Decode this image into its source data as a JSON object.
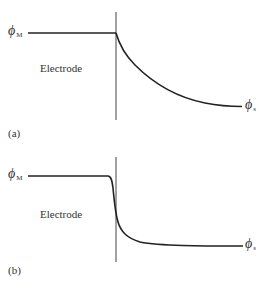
{
  "panels": [
    {
      "id": "a",
      "panel_label": "(a)",
      "region_label": "Electrode",
      "left_potential": {
        "symbol": "ϕ",
        "subscript": "M"
      },
      "right_potential": {
        "symbol": "ϕ",
        "subscript": "s"
      },
      "description": "Potential profile: constant ϕM inside electrode, gradual exponential decay into solution toward ϕs"
    },
    {
      "id": "b",
      "panel_label": "(b)",
      "region_label": "Electrode",
      "left_potential": {
        "symbol": "ϕ",
        "subscript": "M"
      },
      "right_potential": {
        "symbol": "ϕ",
        "subscript": "s"
      },
      "description": "Potential profile: constant ϕM, steep drop at the interface, then short diffuse decay to ϕs"
    }
  ],
  "colors": {
    "line": "#222222",
    "text": "#333333",
    "background": "#ffffff"
  }
}
